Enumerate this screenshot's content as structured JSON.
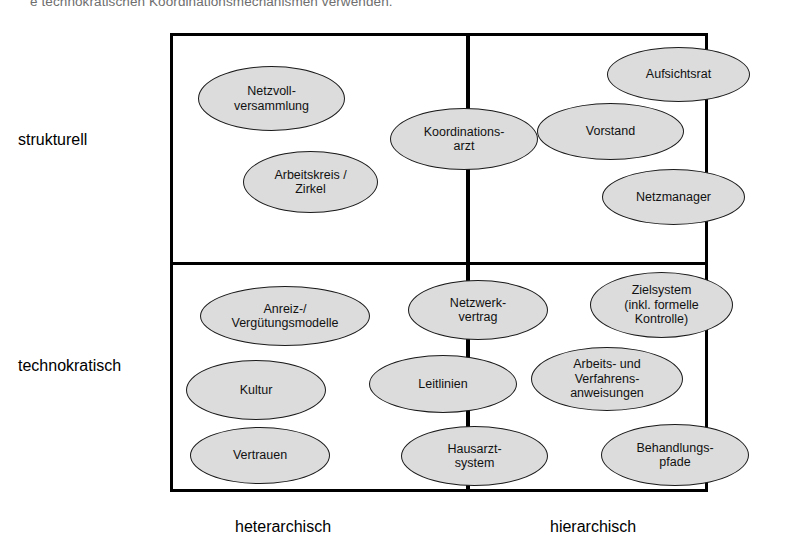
{
  "caption": {
    "text": "e technokratischen Koordinationsmechanismen verwenden."
  },
  "axes": {
    "rows": [
      {
        "id": "structurell",
        "label": "strukturell"
      },
      {
        "id": "technokratisch",
        "label": "technokratisch"
      }
    ],
    "columns": [
      {
        "id": "heterarchisch",
        "label": "heterarchisch"
      },
      {
        "id": "hierarchisch",
        "label": "hierarchisch"
      }
    ]
  },
  "nodes": [
    {
      "id": "netzvollversammlung",
      "label": "Netzvoll-\nversammlung",
      "row": "strukturell",
      "column": "heterarchisch",
      "x": 198,
      "y": 66,
      "w": 147,
      "h": 65
    },
    {
      "id": "arbeitskreis-zirkel",
      "label": "Arbeitskreis /\nZirkel",
      "row": "strukturell",
      "column": "heterarchisch",
      "x": 243,
      "y": 151,
      "w": 135,
      "h": 62
    },
    {
      "id": "koordinationsarzt",
      "label": "Koordinations-\narzt",
      "row": "strukturell",
      "column": "beide",
      "x": 390,
      "y": 108,
      "w": 148,
      "h": 62
    },
    {
      "id": "aufsichtsrat",
      "label": "Aufsichtsrat",
      "row": "strukturell",
      "column": "hierarchisch",
      "x": 607,
      "y": 47,
      "w": 143,
      "h": 55
    },
    {
      "id": "vorstand",
      "label": "Vorstand",
      "row": "strukturell",
      "column": "hierarchisch",
      "x": 537,
      "y": 103,
      "w": 147,
      "h": 57
    },
    {
      "id": "netzmanager",
      "label": "Netzmanager",
      "row": "strukturell",
      "column": "hierarchisch",
      "x": 602,
      "y": 169,
      "w": 143,
      "h": 56
    },
    {
      "id": "anreiz-verguetungsmodelle",
      "label": "Anreiz-/\nVergütungsmodelle",
      "row": "technokratisch",
      "column": "heterarchisch",
      "x": 200,
      "y": 286,
      "w": 170,
      "h": 60
    },
    {
      "id": "netzwerkvertrag",
      "label": "Netzwerk-\nvertrag",
      "row": "technokratisch",
      "column": "beide",
      "x": 408,
      "y": 280,
      "w": 140,
      "h": 60
    },
    {
      "id": "zielsystem",
      "label": "Zielsystem\n(inkl. formelle\nKontrolle)",
      "row": "technokratisch",
      "column": "hierarchisch",
      "x": 590,
      "y": 272,
      "w": 143,
      "h": 66
    },
    {
      "id": "kultur",
      "label": "Kultur",
      "row": "technokratisch",
      "column": "heterarchisch",
      "x": 186,
      "y": 360,
      "w": 140,
      "h": 60
    },
    {
      "id": "leitlinien",
      "label": "Leitlinien",
      "row": "technokratisch",
      "column": "beide",
      "x": 369,
      "y": 355,
      "w": 148,
      "h": 58
    },
    {
      "id": "arbeits-verfahrensanweisungen",
      "label": "Arbeits- und\nVerfahrens-\nanweisungen",
      "row": "technokratisch",
      "column": "hierarchisch",
      "x": 531,
      "y": 347,
      "w": 152,
      "h": 64
    },
    {
      "id": "vertrauen",
      "label": "Vertrauen",
      "row": "technokratisch",
      "column": "heterarchisch",
      "x": 190,
      "y": 427,
      "w": 140,
      "h": 57
    },
    {
      "id": "hausarztsystem",
      "label": "Hausarzt-\nsystem",
      "row": "technokratisch",
      "column": "beide",
      "x": 401,
      "y": 426,
      "w": 147,
      "h": 60
    },
    {
      "id": "behandlungspfade",
      "label": "Behandlungs-\npfade",
      "row": "technokratisch",
      "column": "hierarchisch",
      "x": 601,
      "y": 424,
      "w": 148,
      "h": 62
    }
  ],
  "style": {
    "node_fill": "#dcdcdc",
    "node_stroke": "#1a1a1a",
    "frame_stroke": "#000000",
    "background": "#ffffff"
  }
}
